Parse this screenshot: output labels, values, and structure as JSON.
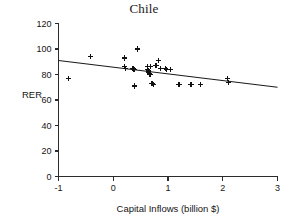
{
  "chart_data": {
    "type": "scatter",
    "title": "Chile",
    "xlabel": "Capital Inflows (billion $)",
    "ylabel": "RER",
    "xlim": [
      -1,
      3
    ],
    "ylim": [
      0,
      120
    ],
    "xticks": [
      -1,
      0,
      1,
      2,
      3
    ],
    "yticks": [
      0,
      20,
      40,
      60,
      80,
      100,
      120
    ],
    "xtick_labels": [
      "-1",
      "0",
      "1",
      "2",
      "3"
    ],
    "ytick_labels": [
      "0",
      "20",
      "40",
      "60",
      "80",
      "100",
      "120"
    ],
    "grid": false,
    "legend": false,
    "marker": "plus",
    "marker_color": "#111111",
    "series": [
      {
        "name": "RER vs Capital Inflows",
        "points": [
          [
            -0.82,
            77
          ],
          [
            -0.41,
            94
          ],
          [
            0.2,
            93
          ],
          [
            0.21,
            86
          ],
          [
            0.22,
            85
          ],
          [
            0.36,
            85
          ],
          [
            0.38,
            84
          ],
          [
            0.39,
            71
          ],
          [
            0.44,
            100
          ],
          [
            0.62,
            86
          ],
          [
            0.63,
            84
          ],
          [
            0.64,
            83
          ],
          [
            0.65,
            82
          ],
          [
            0.66,
            81
          ],
          [
            0.67,
            80
          ],
          [
            0.68,
            86
          ],
          [
            0.7,
            73
          ],
          [
            0.72,
            73
          ],
          [
            0.74,
            72
          ],
          [
            0.78,
            87
          ],
          [
            0.83,
            91
          ],
          [
            0.86,
            85
          ],
          [
            0.95,
            85
          ],
          [
            0.98,
            84
          ],
          [
            1.05,
            84
          ],
          [
            1.2,
            72
          ],
          [
            1.42,
            72
          ],
          [
            1.6,
            72
          ],
          [
            2.09,
            77
          ],
          [
            2.1,
            74
          ]
        ]
      }
    ],
    "trendline": {
      "name": "linear-fit",
      "x_start": -1,
      "y_start": 91,
      "x_end": 3,
      "y_end": 70,
      "color": "#1a1a1a"
    }
  }
}
